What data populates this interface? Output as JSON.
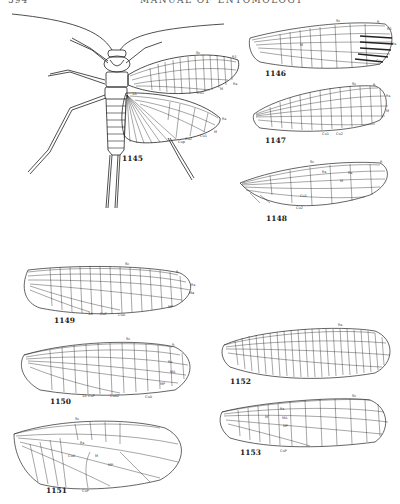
{
  "page": {
    "number": "594",
    "running_head": "MANUAL OF ENTOMOLOGY"
  },
  "figures": [
    {
      "id": "1145",
      "label": "1145",
      "subject": "whole insect with wings (stonefly)",
      "vein_labels": [
        "Sc",
        "R1",
        "Rs",
        "M",
        "Cu1",
        "Cu2",
        "1A",
        "R1",
        "Rs",
        "M",
        "Cu1",
        "Cup"
      ]
    },
    {
      "id": "1146",
      "label": "1146",
      "subject": "forewing",
      "vein_labels": [
        "Sc",
        "R",
        "R1",
        "Rs",
        "M",
        "Cu"
      ]
    },
    {
      "id": "1147",
      "label": "1147",
      "subject": "forewing",
      "vein_labels": [
        "Sc",
        "R",
        "Rs",
        "M",
        "Cu1",
        "Cu2"
      ]
    },
    {
      "id": "1148",
      "label": "1148",
      "subject": "forewing",
      "vein_labels": [
        "Sc",
        "R",
        "Rs",
        "M",
        "Cu1",
        "Cu2"
      ]
    },
    {
      "id": "1149",
      "label": "1149",
      "subject": "forewing",
      "vein_labels": [
        "Sc",
        "R",
        "Rs",
        "Ma",
        "MP",
        "1A",
        "CuP",
        "CuA"
      ]
    },
    {
      "id": "1150",
      "label": "1150",
      "subject": "forewing",
      "vein_labels": [
        "Sc",
        "R",
        "Rs",
        "MA",
        "MP",
        "1A",
        "CuP",
        "CuA2",
        "CuA"
      ]
    },
    {
      "id": "1151",
      "label": "1151",
      "subject": "forewing",
      "vein_labels": [
        "Sc",
        "Rs",
        "CuA",
        "M",
        "MP",
        "CuP"
      ]
    },
    {
      "id": "1152",
      "label": "1152",
      "subject": "forewing",
      "vein_labels": [
        "Rs"
      ]
    },
    {
      "id": "1153",
      "label": "1153",
      "subject": "forewing",
      "vein_labels": [
        "Sc",
        "Rs",
        "M",
        "MA",
        "MP",
        "CuP"
      ]
    }
  ]
}
